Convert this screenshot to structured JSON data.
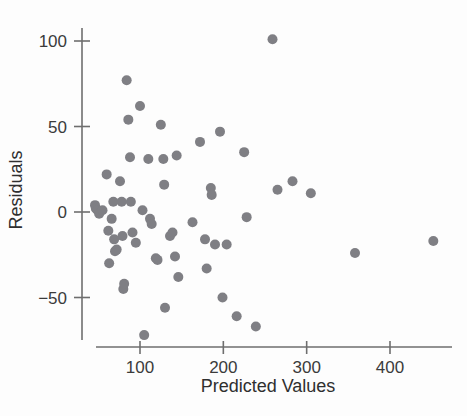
{
  "chart_data": {
    "type": "scatter",
    "title": "",
    "xlabel": "Predicted Values",
    "ylabel": "Residuals",
    "xlim": [
      30,
      470
    ],
    "ylim": [
      -80,
      110
    ],
    "xticks": [
      100,
      200,
      300,
      400
    ],
    "yticks": [
      -50,
      0,
      50,
      100
    ],
    "xtick_labels": [
      "100",
      "200",
      "300",
      "400"
    ],
    "ytick_labels": [
      "−50",
      "0",
      "50",
      "100"
    ],
    "grid": false,
    "legend": null,
    "marker": {
      "shape": "circle",
      "color": "#7f7f84",
      "size": 5
    },
    "series": [
      {
        "name": "residuals",
        "points": [
          [
            46,
            4
          ],
          [
            47,
            2
          ],
          [
            49,
            1
          ],
          [
            51,
            -1
          ],
          [
            55,
            1
          ],
          [
            60,
            22
          ],
          [
            62,
            -11
          ],
          [
            63,
            -30
          ],
          [
            66,
            -4
          ],
          [
            68,
            6
          ],
          [
            69,
            -16
          ],
          [
            70,
            -23
          ],
          [
            72,
            -22
          ],
          [
            76,
            18
          ],
          [
            78,
            6
          ],
          [
            79,
            -14
          ],
          [
            80,
            -45
          ],
          [
            81,
            -42
          ],
          [
            84,
            77
          ],
          [
            86,
            54
          ],
          [
            88,
            32
          ],
          [
            89,
            6
          ],
          [
            91,
            -12
          ],
          [
            95,
            -18
          ],
          [
            100,
            62
          ],
          [
            103,
            1
          ],
          [
            105,
            -72
          ],
          [
            110,
            31
          ],
          [
            112,
            -4
          ],
          [
            114,
            -7
          ],
          [
            119,
            -27
          ],
          [
            121,
            -28
          ],
          [
            125,
            51
          ],
          [
            128,
            31
          ],
          [
            129,
            16
          ],
          [
            130,
            -56
          ],
          [
            136,
            -14
          ],
          [
            139,
            -12
          ],
          [
            142,
            -26
          ],
          [
            144,
            33
          ],
          [
            146,
            -38
          ],
          [
            163,
            -6
          ],
          [
            172,
            41
          ],
          [
            178,
            -16
          ],
          [
            180,
            -33
          ],
          [
            185,
            14
          ],
          [
            186,
            10
          ],
          [
            190,
            -19
          ],
          [
            196,
            47
          ],
          [
            199,
            -50
          ],
          [
            204,
            -19
          ],
          [
            216,
            -61
          ],
          [
            225,
            35
          ],
          [
            228,
            -3
          ],
          [
            239,
            -67
          ],
          [
            259,
            101
          ],
          [
            265,
            13
          ],
          [
            283,
            18
          ],
          [
            305,
            11
          ],
          [
            358,
            -24
          ],
          [
            452,
            -17
          ]
        ]
      }
    ]
  },
  "axes": {
    "y_title": "Residuals",
    "x_title": "Predicted Values"
  }
}
